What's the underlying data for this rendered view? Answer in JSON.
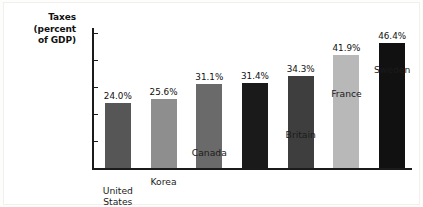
{
  "chart_data": {
    "type": "bar",
    "title": "Taxes (percent of GDP)",
    "title_lines": [
      "Taxes",
      "(percent",
      "of GDP)"
    ],
    "xlabel": "",
    "ylabel": "Taxes (percent of GDP)",
    "ylim": [
      0,
      52
    ],
    "grid": false,
    "legend": "none",
    "yticks": [
      {
        "value": 50,
        "label": "50%"
      },
      {
        "value": 40,
        "label": "40"
      },
      {
        "value": 30,
        "label": "30"
      },
      {
        "value": 20,
        "label": "20"
      },
      {
        "value": 10,
        "label": "10"
      }
    ],
    "categories": [
      "United States",
      "Korea",
      "Canada",
      "Israel",
      "Britain",
      "France",
      "Sweden"
    ],
    "category_lines": [
      [
        "United",
        "States"
      ],
      [
        "Korea"
      ],
      [
        "Canada"
      ],
      [
        "Israel"
      ],
      [
        "Britain"
      ],
      [
        "France"
      ],
      [
        "Sweden"
      ]
    ],
    "values": [
      24.0,
      25.6,
      31.1,
      31.4,
      34.3,
      41.9,
      46.4
    ],
    "value_labels": [
      "24.0%",
      "25.6%",
      "31.1%",
      "31.4%",
      "34.3%",
      "41.9%",
      "46.4%"
    ],
    "bar_colors": [
      "#565656",
      "#8e8e8e",
      "#6a6a6a",
      "#1a1a1a",
      "#3e3e3e",
      "#b8b8b8",
      "#111111"
    ]
  },
  "colors": {
    "axis": "#1b1b1b",
    "background": "#ffffff",
    "text": "#111111"
  }
}
